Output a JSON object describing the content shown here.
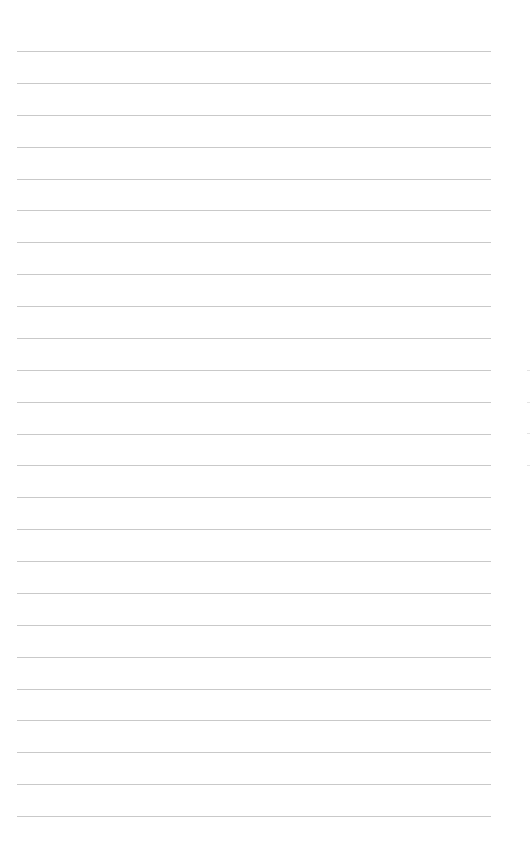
{
  "document": {
    "type": "lined-paper",
    "rule_count": 25,
    "rule_color": "#c9c9c9",
    "background_color": "#ffffff",
    "text": ""
  }
}
